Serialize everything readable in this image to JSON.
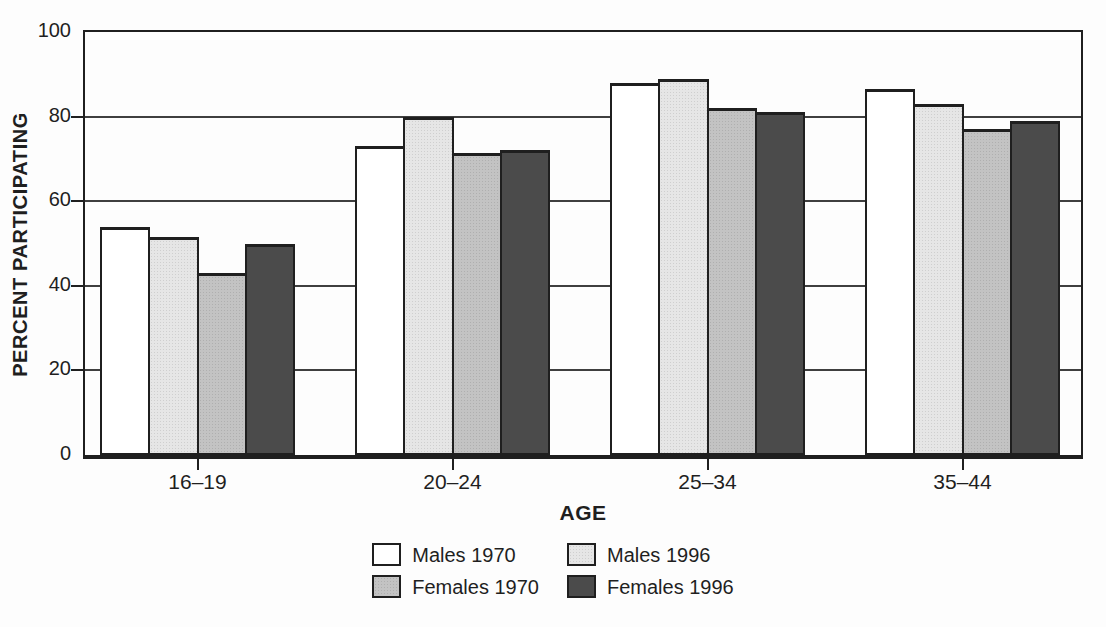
{
  "figure": {
    "background": "#fdfdfd",
    "ink_color": "#1f1f1f",
    "gridline_color": "#3f3f3f"
  },
  "chart_data": {
    "type": "bar",
    "title": "",
    "categories": [
      "16–19",
      "20–24",
      "25–34",
      "35–44"
    ],
    "series": [
      {
        "name": "Males 1970",
        "color": "#ffffff",
        "values": [
          54,
          73,
          88,
          86.5
        ]
      },
      {
        "name": "Males 1996",
        "color": "#e6e6e6",
        "values": [
          51.5,
          80,
          89,
          83
        ]
      },
      {
        "name": "Females 1970",
        "color": "#c3c3c3",
        "values": [
          43,
          71.5,
          82,
          77
        ]
      },
      {
        "name": "Females 1996",
        "color": "#4b4b4b",
        "values": [
          50,
          72,
          81,
          79
        ]
      }
    ],
    "xlabel": "AGE",
    "ylabel": "PERCENT PARTICIPATING",
    "ylim": [
      0,
      100
    ],
    "yticks": [
      0,
      20,
      40,
      60,
      80,
      100
    ],
    "grid": true,
    "legend_position": "bottom-center",
    "legend_columns": 2
  }
}
